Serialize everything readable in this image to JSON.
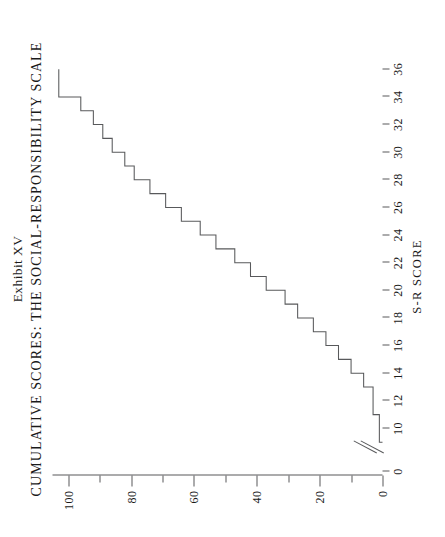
{
  "title": {
    "line1": "Exhibit XV",
    "line2": "CUMULATIVE SCORES:  THE SOCIAL-RESPONSIBILITY SCALE"
  },
  "axes": {
    "x_title": "S-R SCORE",
    "x_break_label_low": "0",
    "x_origin_label": "0"
  },
  "colors": {
    "ink": "#1a1a1a",
    "line": "#58595b",
    "background": "#ffffff"
  },
  "chart_data": {
    "type": "line",
    "subtype": "cumulative-step",
    "title": "CUMULATIVE SCORES:  THE SOCIAL-RESPONSIBILITY SCALE",
    "exhibit": "Exhibit XV",
    "xlabel": "S-R SCORE",
    "ylabel": "",
    "xlim": [
      9,
      37
    ],
    "ylim": [
      0,
      105
    ],
    "grid": false,
    "legend": null,
    "axis_break": {
      "between": [
        0,
        10
      ],
      "style": "double-slash"
    },
    "x_ticks": [
      0,
      10,
      12,
      14,
      16,
      18,
      20,
      22,
      24,
      26,
      28,
      30,
      32,
      34,
      36
    ],
    "x_tick_labels": [
      "0",
      "10",
      "12",
      "14",
      "16",
      "18",
      "20",
      "22",
      "24",
      "26",
      "28",
      "30",
      "32",
      "34",
      "36"
    ],
    "y_ticks": [
      0,
      20,
      40,
      60,
      80,
      100
    ],
    "y_tick_labels": [
      "0",
      "20",
      "40",
      "60",
      "80",
      "100"
    ],
    "y_minor_ticks": [
      10,
      30,
      50,
      70,
      90
    ],
    "x": [
      9,
      10,
      11,
      12,
      13,
      14,
      15,
      16,
      17,
      18,
      19,
      20,
      21,
      22,
      23,
      24,
      25,
      26,
      27,
      28,
      29,
      30,
      31,
      32,
      33,
      34,
      35,
      36
    ],
    "values": [
      0,
      1,
      1,
      3,
      3,
      6,
      10,
      14,
      18,
      22,
      27,
      31,
      37,
      42,
      47,
      53,
      58,
      64,
      69,
      74,
      79,
      82,
      86,
      89,
      92,
      96,
      99,
      103
    ],
    "series": [
      {
        "name": "Cumulative percent",
        "x": [
          9,
          10,
          11,
          12,
          13,
          14,
          15,
          16,
          17,
          18,
          19,
          20,
          21,
          22,
          23,
          24,
          25,
          26,
          27,
          28,
          29,
          30,
          31,
          32,
          33,
          34,
          36
        ],
        "values": [
          0,
          1,
          1,
          3,
          3,
          6,
          10,
          14,
          18,
          22,
          27,
          31,
          37,
          42,
          47,
          53,
          58,
          64,
          69,
          74,
          79,
          82,
          86,
          89,
          92,
          96,
          103
        ]
      }
    ]
  }
}
